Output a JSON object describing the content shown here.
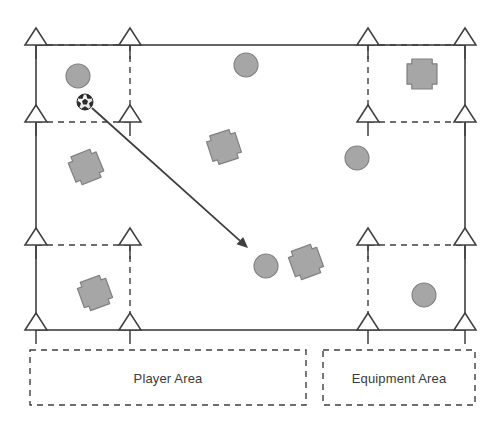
{
  "diagram": {
    "canvas": {
      "width": 499,
      "height": 434
    },
    "colors": {
      "line": "#3f3f3f",
      "marker_fill": "#a6a6a6",
      "marker_stroke": "#808080",
      "text": "#3b3b3b",
      "cone_fill": "#ffffff",
      "ball_dark": "#2b2b2b",
      "ball_light": "#f2f2f2"
    },
    "field": {
      "left": 36,
      "top": 45,
      "right": 465,
      "bottom": 330,
      "stroke_width": 1.6
    },
    "cones": [
      {
        "name": "cone-r1c1",
        "x": 36,
        "y": 45
      },
      {
        "name": "cone-r1c2",
        "x": 130,
        "y": 45
      },
      {
        "name": "cone-r1c3",
        "x": 368,
        "y": 45
      },
      {
        "name": "cone-r1c4",
        "x": 465,
        "y": 45
      },
      {
        "name": "cone-r2c1",
        "x": 36,
        "y": 122
      },
      {
        "name": "cone-r2c2",
        "x": 130,
        "y": 122
      },
      {
        "name": "cone-r2c3",
        "x": 368,
        "y": 122
      },
      {
        "name": "cone-r2c4",
        "x": 465,
        "y": 122
      },
      {
        "name": "cone-r3c1",
        "x": 36,
        "y": 245
      },
      {
        "name": "cone-r3c2",
        "x": 130,
        "y": 245
      },
      {
        "name": "cone-r3c3",
        "x": 368,
        "y": 245
      },
      {
        "name": "cone-r3c4",
        "x": 465,
        "y": 245
      },
      {
        "name": "cone-r4c1",
        "x": 36,
        "y": 330
      },
      {
        "name": "cone-r4c2",
        "x": 130,
        "y": 330
      },
      {
        "name": "cone-r4c3",
        "x": 368,
        "y": 330
      },
      {
        "name": "cone-r4c4",
        "x": 465,
        "y": 330
      }
    ],
    "cone_shape": {
      "half_width": 11,
      "height": 17,
      "stem": 14
    },
    "dashed_segments": [
      {
        "name": "dash-top-left-horizontal",
        "x1": 36,
        "y1": 45,
        "x2": 130,
        "y2": 45
      },
      {
        "name": "dash-top-left-vertical",
        "x1": 130,
        "y1": 45,
        "x2": 130,
        "y2": 122
      },
      {
        "name": "dash-mid-left-horizontal",
        "x1": 36,
        "y1": 122,
        "x2": 130,
        "y2": 122
      },
      {
        "name": "dash-top-right-horizontal",
        "x1": 368,
        "y1": 45,
        "x2": 465,
        "y2": 45
      },
      {
        "name": "dash-top-right-vertical",
        "x1": 368,
        "y1": 45,
        "x2": 368,
        "y2": 122
      },
      {
        "name": "dash-mid-right-horizontal",
        "x1": 368,
        "y1": 122,
        "x2": 465,
        "y2": 122
      },
      {
        "name": "dash-bot-left-horizontal",
        "x1": 36,
        "y1": 245,
        "x2": 130,
        "y2": 245
      },
      {
        "name": "dash-bot-left-vertical",
        "x1": 130,
        "y1": 245,
        "x2": 130,
        "y2": 330
      },
      {
        "name": "dash-bot-right-horizontal",
        "x1": 368,
        "y1": 245,
        "x2": 465,
        "y2": 245
      },
      {
        "name": "dash-bot-right-vertical",
        "x1": 368,
        "y1": 245,
        "x2": 368,
        "y2": 330
      }
    ],
    "players": [
      {
        "name": "player-circle-1",
        "x": 78,
        "y": 76,
        "r": 12
      },
      {
        "name": "player-circle-2",
        "x": 246,
        "y": 65,
        "r": 12
      },
      {
        "name": "player-circle-3",
        "x": 357,
        "y": 158,
        "r": 12
      },
      {
        "name": "player-circle-4",
        "x": 266,
        "y": 266,
        "r": 12
      },
      {
        "name": "player-circle-5",
        "x": 424,
        "y": 295,
        "r": 12
      }
    ],
    "equipment": [
      {
        "name": "equipment-cross-1",
        "x": 86,
        "y": 167,
        "size": 30,
        "rotation": -22
      },
      {
        "name": "equipment-cross-2",
        "x": 224,
        "y": 147,
        "size": 30,
        "rotation": -18
      },
      {
        "name": "equipment-cross-3",
        "x": 422,
        "y": 74,
        "size": 30,
        "rotation": 0
      },
      {
        "name": "equipment-cross-4",
        "x": 95,
        "y": 293,
        "size": 30,
        "rotation": -20
      },
      {
        "name": "equipment-cross-5",
        "x": 306,
        "y": 262,
        "size": 30,
        "rotation": -20
      }
    ],
    "ball": {
      "name": "soccer-ball",
      "x": 85,
      "y": 102,
      "r": 8
    },
    "arrow": {
      "name": "pass-direction-arrow",
      "x1": 92,
      "y1": 108,
      "x2": 248,
      "y2": 248,
      "head_length": 11,
      "head_width": 5
    },
    "legend": {
      "player_area": {
        "label": "Player Area",
        "box": {
          "x": 30,
          "y": 350,
          "width": 276,
          "height": 55
        }
      },
      "equipment_area": {
        "label": "Equipment Area",
        "box": {
          "x": 323,
          "y": 350,
          "width": 152,
          "height": 55
        }
      }
    }
  }
}
